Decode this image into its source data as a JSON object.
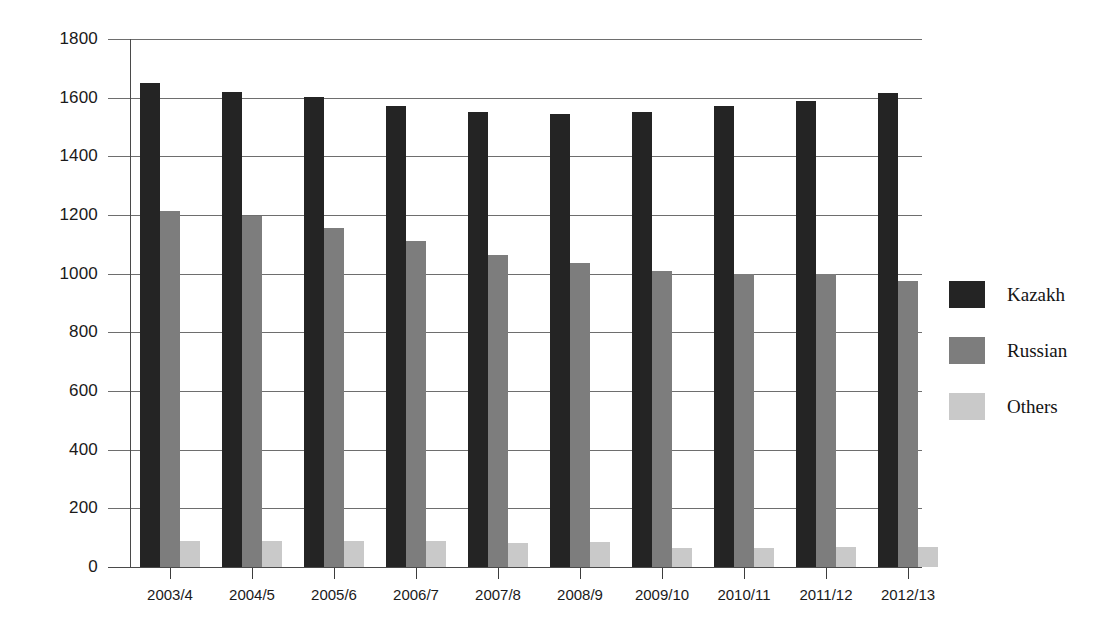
{
  "chart_data": {
    "type": "bar",
    "title": "",
    "xlabel": "",
    "ylabel": "",
    "ylim": [
      0,
      1800
    ],
    "yticks": [
      0,
      200,
      400,
      600,
      800,
      1000,
      1200,
      1400,
      1600,
      1800
    ],
    "ytick_labels": [
      "0",
      "200",
      "400",
      "600",
      "800",
      "1000",
      "1200",
      "1400",
      "1600",
      "1800"
    ],
    "grid": true,
    "legend_position": "right",
    "categories": [
      "2003/4",
      "2004/5",
      "2005/6",
      "2006/7",
      "2007/8",
      "2008/9",
      "2009/10",
      "2010/11",
      "2011/12",
      "2012/13"
    ],
    "series": [
      {
        "name": "Kazakh",
        "color": "#242424",
        "values": [
          1650,
          1620,
          1602,
          1570,
          1552,
          1545,
          1552,
          1570,
          1590,
          1615
        ]
      },
      {
        "name": "Russian",
        "color": "#7d7d7d",
        "values": [
          1212,
          1195,
          1155,
          1110,
          1065,
          1035,
          1010,
          1000,
          998,
          975
        ]
      },
      {
        "name": "Others",
        "color": "#c9c9c9",
        "values": [
          88,
          88,
          88,
          88,
          82,
          85,
          66,
          64,
          68,
          68
        ]
      }
    ]
  },
  "legend": {
    "items": [
      {
        "label": "Kazakh",
        "swatch": "kazakh"
      },
      {
        "label": "Russian",
        "swatch": "russian"
      },
      {
        "label": "Others",
        "swatch": "others"
      }
    ]
  }
}
